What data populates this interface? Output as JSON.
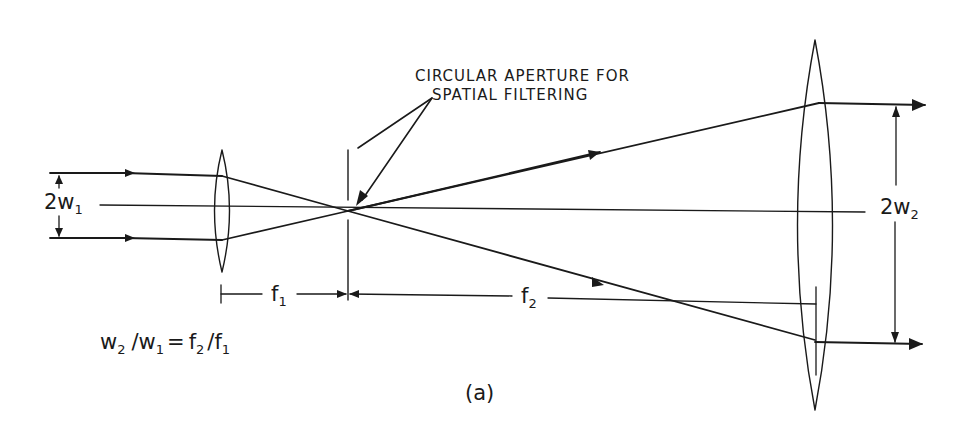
{
  "figure": {
    "caption": "(a)",
    "annotation": {
      "line1": "CIRCULAR APERTURE FOR",
      "line2": "SPATIAL FILTERING"
    },
    "labels": {
      "input_width": {
        "main": "2w",
        "sub": "1"
      },
      "output_width": {
        "main": "2w",
        "sub": "2"
      },
      "focal1": {
        "main": "f",
        "sub": "1"
      },
      "focal2": {
        "main": "f",
        "sub": "2"
      }
    },
    "equation": {
      "lhs_num": "w",
      "lhs_num_sub": "2",
      "slash1": "/",
      "lhs_den": "w",
      "lhs_den_sub": "1",
      "equals": "=",
      "rhs_num": "f",
      "rhs_num_sub": "2",
      "slash2": "/",
      "rhs_den": "f",
      "rhs_den_sub": "1"
    },
    "ink_color": "#1a1a1a",
    "background": "#ffffff"
  }
}
